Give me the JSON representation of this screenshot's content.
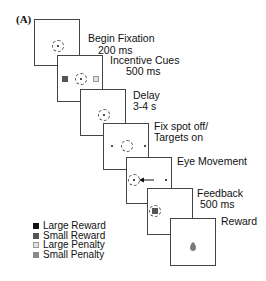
{
  "figure": {
    "panel_tag": "(A)"
  },
  "steps": [
    {
      "id": "begin-fixation",
      "title": "Begin Fixation",
      "duration": "200 ms"
    },
    {
      "id": "incentive-cues",
      "title": "Incentive Cues",
      "duration": "500 ms"
    },
    {
      "id": "delay",
      "title": "Delay",
      "duration": "3-4 s"
    },
    {
      "id": "fix-spot-off",
      "title": "Fix spot off/",
      "duration": "Targets on"
    },
    {
      "id": "eye-movement",
      "title": "Eye Movement"
    },
    {
      "id": "feedback",
      "title": "Feedback",
      "duration": "500 ms"
    },
    {
      "id": "reward",
      "title": "Reward"
    }
  ],
  "legend": [
    {
      "label": "Large Reward",
      "color": "#111111"
    },
    {
      "label": "Small Reward",
      "color": "#555555"
    },
    {
      "label": "Large Penalty",
      "color": "#e2e2e2"
    },
    {
      "label": "Small Penalty",
      "color": "#8a8a8a"
    }
  ],
  "colors": {
    "panel_border": "#444444",
    "fixation_ring": "#555555",
    "reward_drop": "#7a7a7a"
  }
}
